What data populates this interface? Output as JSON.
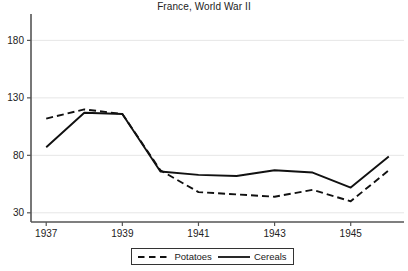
{
  "chart_data": {
    "type": "line",
    "title": "France, World War II",
    "xlabel": "",
    "ylabel": "",
    "x": [
      1937,
      1938,
      1939,
      1940,
      1941,
      1942,
      1943,
      1944,
      1945,
      1946
    ],
    "xticks": [
      1937,
      1939,
      1941,
      1943,
      1945
    ],
    "xtick_labels": [
      "1937",
      "1939",
      "1941",
      "1943",
      "1945"
    ],
    "yticks": [
      30,
      80,
      130,
      180
    ],
    "ytick_labels": [
      "30",
      "80",
      "130",
      "180"
    ],
    "xlim": [
      1936.6,
      1946.4
    ],
    "ylim": [
      22,
      196
    ],
    "grid": "horizontal",
    "legend_position": "bottom-center",
    "series": [
      {
        "name": "Potatoes",
        "style": "dashed",
        "color": "#111111",
        "values": [
          112,
          120,
          116,
          67,
          48,
          46,
          44,
          50,
          40,
          67
        ]
      },
      {
        "name": "Cereals",
        "style": "solid",
        "color": "#111111",
        "values": [
          87,
          117,
          116,
          66,
          63,
          62,
          67,
          65,
          52,
          79
        ]
      }
    ]
  },
  "legend": {
    "entries": [
      {
        "label": "Potatoes",
        "style": "dashed"
      },
      {
        "label": "Cereals",
        "style": "solid"
      }
    ]
  },
  "colors": {
    "axis": "#555555",
    "grid": "#e6e6e6",
    "series": "#111111",
    "text": "#222222",
    "background": "#ffffff"
  }
}
